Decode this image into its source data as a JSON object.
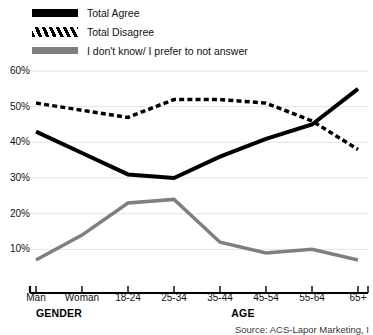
{
  "legend": {
    "items": [
      {
        "label": "Total Agree",
        "swatch": "solid-black-line-swatch",
        "color": "#000000"
      },
      {
        "label": "Total Disagree",
        "swatch": "dashed-black-line-swatch",
        "color": "#000000"
      },
      {
        "label": "I don't know/ I prefer to not answer",
        "swatch": "solid-gray-line-swatch",
        "color": "#7f7f7f"
      }
    ]
  },
  "axis": {
    "y_ticks": [
      "60%",
      "50%",
      "40%",
      "30%",
      "20%",
      "10%"
    ],
    "group_labels": [
      "GENDER",
      "AGE"
    ]
  },
  "source": {
    "text": "Source: ACS-Lapor Marketing, I"
  },
  "chart_data": {
    "type": "line",
    "title": "",
    "subtitle": "",
    "xlabel": "",
    "ylabel": "",
    "ylim": [
      0,
      60
    ],
    "yticks": [
      10,
      20,
      30,
      40,
      50,
      60
    ],
    "ytick_labels": [
      "10%",
      "20%",
      "30%",
      "40%",
      "50%",
      "60%"
    ],
    "grid": true,
    "grid_axis": "y",
    "legend_position": "top-left",
    "value_unit": "percent",
    "categories": [
      "Man",
      "Woman",
      "18-24",
      "25-34",
      "35-44",
      "45-54",
      "55-64",
      "65+"
    ],
    "category_groups": [
      {
        "name": "GENDER",
        "categories": [
          "Man",
          "Woman"
        ]
      },
      {
        "name": "AGE",
        "categories": [
          "18-24",
          "25-34",
          "35-44",
          "45-54",
          "55-64",
          "65+"
        ]
      }
    ],
    "series": [
      {
        "name": "Total Agree",
        "color": "#000000",
        "style": "solid",
        "width": 4,
        "values": [
          43,
          37,
          31,
          30,
          36,
          41,
          45,
          55
        ]
      },
      {
        "name": "Total Disagree",
        "color": "#000000",
        "style": "dashed",
        "width": 3.5,
        "values": [
          51,
          49,
          47,
          52,
          52,
          51,
          46,
          38
        ]
      },
      {
        "name": "I don't know/ I prefer to not answer",
        "color": "#7f7f7f",
        "style": "solid",
        "width": 3.5,
        "values": [
          7,
          14,
          23,
          24,
          12,
          9,
          10,
          7
        ]
      }
    ]
  }
}
